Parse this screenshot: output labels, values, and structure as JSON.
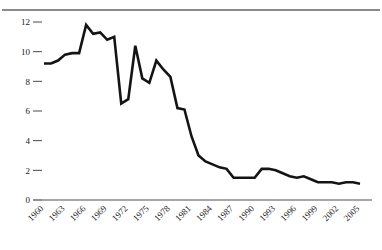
{
  "chart_data": {
    "type": "line",
    "title": "",
    "subtitle": "",
    "xlabel": "",
    "ylabel": "",
    "xlim": [
      1960,
      2005
    ],
    "ylim": [
      0,
      12
    ],
    "grid": false,
    "legend": null,
    "y_ticks": [
      0,
      2,
      4,
      6,
      8,
      10,
      12
    ],
    "y_tick_labels": [
      "0",
      "2",
      "4",
      "6",
      "8",
      "10",
      "12"
    ],
    "x_ticks": [
      1960,
      1963,
      1966,
      1969,
      1972,
      1975,
      1978,
      1981,
      1984,
      1987,
      1990,
      1993,
      1996,
      1999,
      2002,
      2005
    ],
    "x_tick_labels": [
      "1960",
      "1963",
      "1966",
      "1969",
      "1972",
      "1975",
      "1978",
      "1981",
      "1984",
      "1987",
      "1990",
      "1993",
      "1996",
      "1999",
      "2002",
      "2005"
    ],
    "x_tick_rotation": 45,
    "line_color": "#141414",
    "axis_color": "#8a8a8a",
    "x": [
      1960,
      1961,
      1962,
      1963,
      1964,
      1965,
      1966,
      1967,
      1968,
      1969,
      1970,
      1971,
      1972,
      1973,
      1974,
      1975,
      1976,
      1977,
      1978,
      1979,
      1980,
      1981,
      1982,
      1983,
      1984,
      1985,
      1986,
      1987,
      1988,
      1989,
      1990,
      1991,
      1992,
      1993,
      1994,
      1995,
      1996,
      1997,
      1998,
      1999,
      2000,
      2001,
      2002,
      2003,
      2004,
      2005
    ],
    "values": [
      9.2,
      9.2,
      9.4,
      9.8,
      9.9,
      9.9,
      11.8,
      11.2,
      11.3,
      10.8,
      11.0,
      6.5,
      6.8,
      10.4,
      8.2,
      7.9,
      9.4,
      8.8,
      8.3,
      6.2,
      6.1,
      4.3,
      3.0,
      2.6,
      2.4,
      2.2,
      2.1,
      1.5,
      1.5,
      1.5,
      1.5,
      2.1,
      2.1,
      2.0,
      1.8,
      1.6,
      1.5,
      1.6,
      1.4,
      1.2,
      1.2,
      1.2,
      1.1,
      1.2,
      1.2,
      1.1
    ],
    "series": [
      {
        "name": "series-1",
        "values": [
          9.2,
          9.2,
          9.4,
          9.8,
          9.9,
          9.9,
          11.8,
          11.2,
          11.3,
          10.8,
          11.0,
          6.5,
          6.8,
          10.4,
          8.2,
          7.9,
          9.4,
          8.8,
          8.3,
          6.2,
          6.1,
          4.3,
          3.0,
          2.6,
          2.4,
          2.2,
          2.1,
          1.5,
          1.5,
          1.5,
          1.5,
          2.1,
          2.1,
          2.0,
          1.8,
          1.6,
          1.5,
          1.6,
          1.4,
          1.2,
          1.2,
          1.2,
          1.1,
          1.2,
          1.2,
          1.1
        ]
      }
    ]
  }
}
